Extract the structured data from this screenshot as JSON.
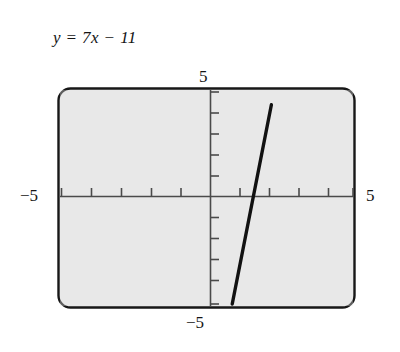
{
  "figure": {
    "equation_label": "y = 7x − 11",
    "screen_background": "#eaeaea",
    "frame_color": "#171717",
    "axis_color": "#4a4a4a",
    "curve_color": "#111111",
    "labels": {
      "top": "5",
      "bottom": "−5",
      "left": "−5",
      "right": "5"
    }
  },
  "chart_data": {
    "type": "line",
    "title": "y = 7x − 11",
    "xlabel": "",
    "ylabel": "",
    "xlim": [
      -5,
      5
    ],
    "ylim": [
      -5,
      5
    ],
    "grid": false,
    "legend": null,
    "xticks": [
      -5,
      -4,
      -3,
      -2,
      -1,
      0,
      1,
      2,
      3,
      4,
      5
    ],
    "yticks": [
      -5,
      -4,
      -3,
      -2,
      -1,
      0,
      1,
      2,
      3,
      4,
      5
    ],
    "xtick_labels": [
      "-5",
      "",
      "",
      "",
      "",
      "",
      "",
      "",
      "",
      "",
      "5"
    ],
    "ytick_labels": [
      "-5",
      "",
      "",
      "",
      "",
      "",
      "",
      "",
      "",
      "",
      "5"
    ],
    "series": [
      {
        "name": "y = 7x - 11",
        "equation": "y = 7x - 11",
        "slope": 7,
        "intercept": -11,
        "x": [
          0.857,
          2.2
        ],
        "y": [
          -5,
          4.4
        ],
        "x_intercept": 1.571,
        "points": [
          {
            "x": 0.857,
            "y": -5
          },
          {
            "x": 1.571,
            "y": 0
          },
          {
            "x": 2.2,
            "y": 4.4
          }
        ]
      }
    ]
  }
}
